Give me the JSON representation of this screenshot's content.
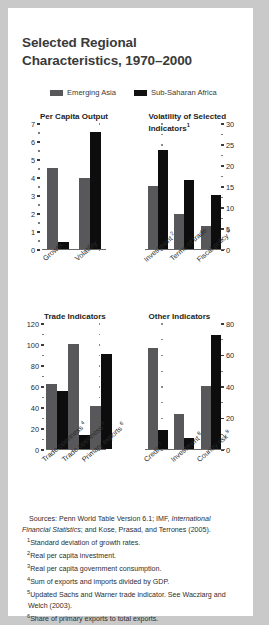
{
  "title": "Selected Regional Characteristics, 1970–2000",
  "legend": {
    "items": [
      {
        "label": "Emerging Asia",
        "color": "#58585a"
      },
      {
        "label": "Sub-Saharan Africa",
        "color": "#0d0d0d"
      }
    ]
  },
  "chart_data": [
    {
      "type": "bar",
      "title": "Per Capita Output",
      "categories": [
        "Growth",
        "Volatility"
      ],
      "series": [
        {
          "name": "Emerging Asia",
          "values": [
            4.5,
            3.95
          ]
        },
        {
          "name": "Sub-Saharan Africa",
          "values": [
            0.35,
            6.5
          ]
        }
      ],
      "ylim": [
        0,
        7
      ],
      "yticks": [
        0,
        1,
        2,
        3,
        4,
        5,
        6,
        7
      ],
      "axis_side": "left",
      "xlabel": "",
      "ylabel": "",
      "grid": false
    },
    {
      "type": "bar",
      "title": "Volatility of Selected Indicators",
      "title_sup": "1",
      "categories": [
        "Investment",
        "Terms of trade",
        "Fiscal policy"
      ],
      "category_sups": [
        "2",
        "",
        "3"
      ],
      "series": [
        {
          "name": "Emerging Asia",
          "values": [
            14.8,
            8.3,
            5.5
          ]
        },
        {
          "name": "Sub-Saharan Africa",
          "values": [
            23.5,
            16.3,
            12.7
          ]
        }
      ],
      "ylim": [
        0,
        30
      ],
      "yticks": [
        0,
        5,
        10,
        15,
        20,
        25,
        30
      ],
      "axis_side": "right",
      "xlabel": "",
      "ylabel": "",
      "grid": false
    },
    {
      "type": "bar",
      "title": "Trade Indicators",
      "categories": [
        "Trade openness",
        "Trade openness",
        "Primary exports"
      ],
      "category_sups": [
        "4",
        "5",
        "6"
      ],
      "series": [
        {
          "name": "Emerging Asia",
          "values": [
            62,
            100,
            41
          ]
        },
        {
          "name": "Sub-Saharan Africa",
          "values": [
            55,
            13,
            90
          ]
        }
      ],
      "ylim": [
        0,
        120
      ],
      "yticks": [
        0,
        20,
        40,
        60,
        80,
        100,
        120
      ],
      "axis_side": "left",
      "xlabel": "",
      "ylabel": "",
      "grid": false
    },
    {
      "type": "bar",
      "title": "Other Indicators",
      "categories": [
        "Credit",
        "Investment",
        "Country risk"
      ],
      "category_sups": [
        "7",
        "8",
        "9"
      ],
      "series": [
        {
          "name": "Emerging Asia",
          "values": [
            64,
            22,
            40
          ]
        },
        {
          "name": "Sub-Saharan Africa",
          "values": [
            12,
            7,
            72
          ]
        }
      ],
      "ylim": [
        0,
        80
      ],
      "yticks": [
        0,
        20,
        40,
        60,
        80
      ],
      "axis_side": "right",
      "xlabel": "",
      "ylabel": "",
      "grid": false
    }
  ],
  "notes": {
    "sources_prefix": "Sources: Penn World Table Version 6.1; IMF, ",
    "sources_italic": "International Financial Statistics",
    "sources_suffix": "; and Kose, Prasad, and Terrones (2005).",
    "items": [
      {
        "num": "1",
        "text": "Standard deviation of growth rates."
      },
      {
        "num": "2",
        "text": "Real per capita investment."
      },
      {
        "num": "3",
        "text": "Real per capita government consumption."
      },
      {
        "num": "4",
        "text": "Sum of exports and imports divided by GDP."
      },
      {
        "num": "5",
        "text": "Updated Sachs and Warner trade indicator. See Wacziarg and Welch (2003)."
      },
      {
        "num": "6",
        "text": "Share of primary exports to total exports."
      }
    ]
  }
}
